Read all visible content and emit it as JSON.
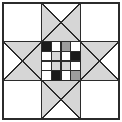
{
  "figure": {
    "kind": "quilt-block-diagram",
    "width": 122,
    "height": 122,
    "background_color": "#ffffff",
    "outline_color": "#2b2b2b",
    "outer_border_width": 2,
    "inner_line_width": 1.5
  },
  "palette": {
    "white": "#ffffff",
    "light_gray": "#d6d6d6",
    "mid_gray": "#9d9d9d",
    "dark_gray": "#5a5a5a",
    "black": "#1a1a1a",
    "line": "#2b2b2b"
  },
  "layout": {
    "type": "3x3-star-block",
    "unit_columns": 3,
    "unit_rows": 3,
    "outer_margin": 3,
    "cell_size": 38.6,
    "description": "Nine-patch star: four plain white corners, four hourglass X units forming the star points, and a pieced four-by-four checker center."
  },
  "units": [
    {
      "id": "unit-top-left",
      "name": "corner-plain-top-left",
      "row": 0,
      "col": 0,
      "type": "plain",
      "fill": "#ffffff"
    },
    {
      "id": "unit-top-center",
      "name": "star-point-top",
      "row": 0,
      "col": 1,
      "type": "hourglass-x",
      "triangles": {
        "top": "#ffffff",
        "right": "#d6d6d6",
        "bottom": "#d6d6d6",
        "left": "#d6d6d6"
      }
    },
    {
      "id": "unit-top-right",
      "name": "corner-plain-top-right",
      "row": 0,
      "col": 2,
      "type": "plain",
      "fill": "#ffffff"
    },
    {
      "id": "unit-middle-left",
      "name": "star-point-left",
      "row": 1,
      "col": 0,
      "type": "hourglass-x",
      "triangles": {
        "top": "#d6d6d6",
        "right": "#d6d6d6",
        "bottom": "#d6d6d6",
        "left": "#ffffff"
      }
    },
    {
      "id": "unit-center",
      "name": "center-checker-grid",
      "row": 1,
      "col": 1,
      "type": "four-patch-grid",
      "grid_rows": 4,
      "grid_cols": 4
    },
    {
      "id": "unit-middle-right",
      "name": "star-point-right",
      "row": 1,
      "col": 2,
      "type": "hourglass-x",
      "triangles": {
        "top": "#d6d6d6",
        "right": "#ffffff",
        "bottom": "#d6d6d6",
        "left": "#d6d6d6"
      }
    },
    {
      "id": "unit-bottom-left",
      "name": "corner-plain-bottom-left",
      "row": 2,
      "col": 0,
      "type": "plain",
      "fill": "#ffffff"
    },
    {
      "id": "unit-bottom-center",
      "name": "star-point-bottom",
      "row": 2,
      "col": 1,
      "type": "hourglass-x",
      "triangles": {
        "top": "#d6d6d6",
        "right": "#d6d6d6",
        "bottom": "#ffffff",
        "left": "#d6d6d6"
      }
    },
    {
      "id": "unit-bottom-right",
      "name": "corner-plain-bottom-right",
      "row": 2,
      "col": 2,
      "type": "plain",
      "fill": "#ffffff"
    }
  ],
  "center_grid": {
    "rows": 4,
    "cols": 4,
    "cell_fills": [
      [
        "#1a1a1a",
        "#ffffff",
        "#9d9d9d",
        "#ffffff"
      ],
      [
        "#ffffff",
        "#d6d6d6",
        "#ffffff",
        "#1a1a1a"
      ],
      [
        "#ffffff",
        "#d6d6d6",
        "#d6d6d6",
        "#ffffff"
      ],
      [
        "#ffffff",
        "#1a1a1a",
        "#ffffff",
        "#9d9d9d"
      ]
    ],
    "cell_names": [
      [
        "center-cell-r1c1",
        "center-cell-r1c2",
        "center-cell-r1c3",
        "center-cell-r1c4"
      ],
      [
        "center-cell-r2c1",
        "center-cell-r2c2",
        "center-cell-r2c3",
        "center-cell-r2c4"
      ],
      [
        "center-cell-r3c1",
        "center-cell-r3c2",
        "center-cell-r3c3",
        "center-cell-r3c4"
      ],
      [
        "center-cell-r4c1",
        "center-cell-r4c2",
        "center-cell-r4c3",
        "center-cell-r4c4"
      ]
    ]
  }
}
